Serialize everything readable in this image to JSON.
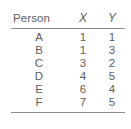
{
  "table": {
    "columns": [
      {
        "key": "person",
        "label": "Person",
        "italic": false
      },
      {
        "key": "x",
        "label": "X",
        "italic": true
      },
      {
        "key": "y",
        "label": "Y",
        "italic": true
      }
    ],
    "rows": [
      {
        "person": "A",
        "x": "1",
        "y": "1"
      },
      {
        "person": "B",
        "x": "1",
        "y": "3"
      },
      {
        "person": "C",
        "x": "3",
        "y": "2"
      },
      {
        "person": "D",
        "x": "4",
        "y": "5"
      },
      {
        "person": "E",
        "x": "6",
        "y": "4"
      },
      {
        "person": "F",
        "x": "7",
        "y": "5"
      }
    ]
  },
  "chart_data": {
    "type": "table",
    "title": "",
    "columns": [
      "Person",
      "X",
      "Y"
    ],
    "categories": [
      "A",
      "B",
      "C",
      "D",
      "E",
      "F"
    ],
    "series": [
      {
        "name": "X",
        "values": [
          1,
          1,
          3,
          4,
          6,
          7
        ]
      },
      {
        "name": "Y",
        "values": [
          1,
          3,
          2,
          5,
          4,
          5
        ]
      }
    ],
    "xlabel": "X",
    "ylabel": "Y",
    "grid": false,
    "legend": "none"
  },
  "style": {
    "text_color": "#5e5e5e",
    "rule_color": "#8b8b8b",
    "background": "#ffffff"
  }
}
